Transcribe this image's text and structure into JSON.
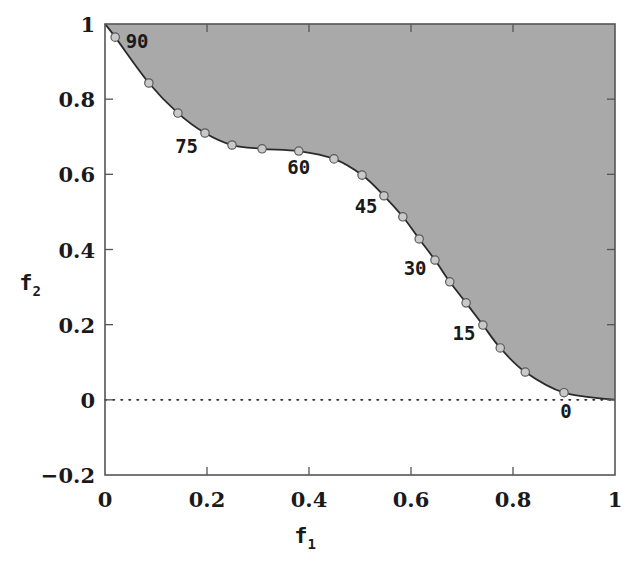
{
  "chart_data": {
    "type": "area",
    "title": "",
    "xlabel": "f1",
    "xlabel_main": "f",
    "xlabel_sub": "1",
    "ylabel": "f2",
    "ylabel_main": "f",
    "ylabel_sub": "2",
    "xlim": [
      0,
      1
    ],
    "ylim": [
      -0.2,
      1
    ],
    "grid": false,
    "legend": null,
    "x_ticks": [
      0,
      0.2,
      0.4,
      0.6,
      0.8,
      1
    ],
    "x_tick_labels": [
      "0",
      "0.2",
      "0.4",
      "0.6",
      "0.8",
      "1"
    ],
    "y_ticks": [
      -0.2,
      0,
      0.2,
      0.4,
      0.6,
      0.8,
      1
    ],
    "y_tick_labels": [
      "−0.2",
      "0",
      "0.2",
      "0.4",
      "0.6",
      "0.8",
      "1"
    ],
    "reference_line": {
      "y": 0,
      "style": "dotted"
    },
    "fill_region": "above curve (dominated/feasible region)",
    "colors": {
      "fill": "#a9a9a9",
      "curve": "#2a2a2a",
      "marker_fill": "#c9c9c9",
      "marker_edge": "#5a5a5a",
      "axis": "#555555"
    },
    "series": [
      {
        "name": "Pareto front",
        "angles_deg": [
          90,
          85,
          80,
          75,
          70,
          65,
          60,
          55,
          50,
          45,
          40,
          35,
          30,
          25,
          20,
          15,
          10,
          5,
          0
        ],
        "x": [
          0.02,
          0.086,
          0.143,
          0.196,
          0.249,
          0.308,
          0.38,
          0.449,
          0.504,
          0.547,
          0.584,
          0.616,
          0.647,
          0.676,
          0.708,
          0.741,
          0.775,
          0.824,
          0.9
        ],
        "y": [
          0.965,
          0.843,
          0.763,
          0.71,
          0.678,
          0.668,
          0.662,
          0.641,
          0.598,
          0.543,
          0.487,
          0.428,
          0.372,
          0.314,
          0.258,
          0.199,
          0.138,
          0.074,
          0.019
        ]
      }
    ],
    "curve_endpoints": {
      "start": [
        0,
        1
      ],
      "end": [
        1,
        0
      ]
    },
    "annotations": [
      {
        "text": "90",
        "x": 0.063,
        "y": 0.955
      },
      {
        "text": "75",
        "x": 0.16,
        "y": 0.675
      },
      {
        "text": "60",
        "x": 0.38,
        "y": 0.62
      },
      {
        "text": "45",
        "x": 0.512,
        "y": 0.517
      },
      {
        "text": "30",
        "x": 0.608,
        "y": 0.35
      },
      {
        "text": "15",
        "x": 0.704,
        "y": 0.177
      },
      {
        "text": "0",
        "x": 0.904,
        "y": -0.03
      }
    ]
  }
}
